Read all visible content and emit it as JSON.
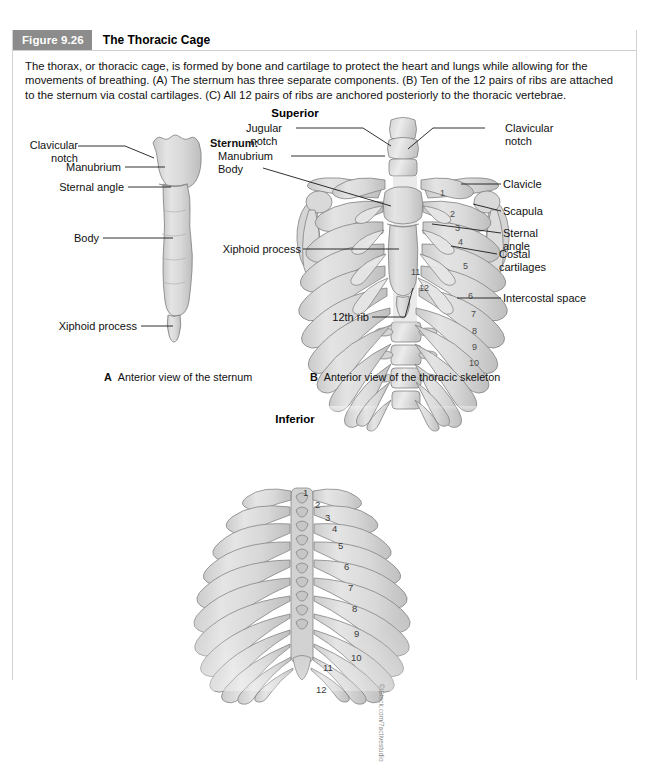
{
  "figure": {
    "number_label": "Figure 9.26",
    "title": "The Thoracic Cage",
    "caption": "The thorax, or thoracic cage, is formed by bone and cartilage to protect the heart and lungs while allowing for the movements of breathing. (A) The sternum has three separate components. (B) Ten of the 12 pairs of ribs are attached to the sternum via costal cartilages. (C) All 12 pairs of ribs are anchored posteriorly to the thoracic vertebrae.",
    "credit": "©iStock.com/7activestudio"
  },
  "orientation": {
    "superior": "Superior",
    "inferior": "Inferior"
  },
  "panel_a": {
    "caption_letter": "A",
    "caption_text": "Anterior view of the sternum",
    "labels": {
      "clavicular_notch": "Clavicular\nnotch",
      "manubrium": "Manubrium",
      "sternal_angle": "Sternal angle",
      "body": "Body",
      "xiphoid_process": "Xiphoid process"
    }
  },
  "panel_b": {
    "caption_letter": "B",
    "caption_text": "Anterior view of the thoracic skeleton",
    "labels": {
      "jugular_notch": "Jugular\nnotch",
      "sternum_heading": "Sternum:",
      "sternum_manubrium": "Manubrium",
      "sternum_body": "Body",
      "xiphoid_process": "Xiphoid process",
      "twelfth_rib": "12th rib",
      "clavicular_notch": "Clavicular\nnotch",
      "clavicle": "Clavicle",
      "scapula": "Scapula",
      "sternal_angle": "Sternal\nangle",
      "costal_cartilages": "Costal\ncartilages",
      "intercostal_space": "Intercostal space"
    },
    "rib_numbers": [
      "1",
      "2",
      "3",
      "4",
      "5",
      "6",
      "7",
      "8",
      "9",
      "10",
      "11",
      "12"
    ]
  },
  "panel_c": {
    "rib_numbers": [
      "1",
      "2",
      "3",
      "4",
      "5",
      "6",
      "7",
      "8",
      "9",
      "10",
      "11",
      "12"
    ]
  },
  "colors": {
    "header_badge": "#8c8c8c",
    "bone_fill": "#dcdcdc",
    "bone_outline": "#7d7d7d",
    "leader_line": "#1a1a1a",
    "border": "#d2d2d2"
  }
}
